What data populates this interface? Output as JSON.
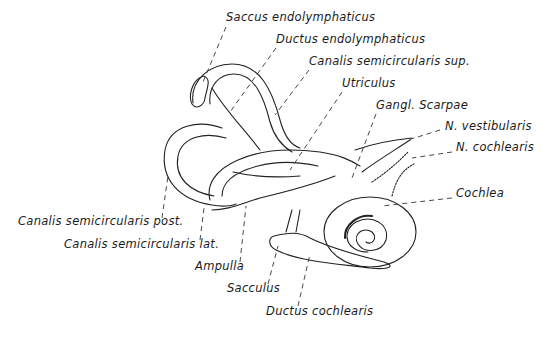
{
  "diagram": {
    "labels": [
      {
        "id": "saccus",
        "text": "Saccus endolymphaticus",
        "x": 226,
        "y": 17
      },
      {
        "id": "ductus_endo",
        "text": "Ductus endolymphaticus",
        "x": 276,
        "y": 39
      },
      {
        "id": "canalis_sup",
        "text": "Canalis semicircularis sup.",
        "x": 309,
        "y": 61
      },
      {
        "id": "utriculus",
        "text": "Utriculus",
        "x": 342,
        "y": 83
      },
      {
        "id": "gangl",
        "text": "Gangl. Scarpae",
        "x": 376,
        "y": 105
      },
      {
        "id": "n_vest",
        "text": "N. vestibularis",
        "x": 445,
        "y": 126
      },
      {
        "id": "n_coch",
        "text": "N. cochlearis",
        "x": 456,
        "y": 147
      },
      {
        "id": "cochlea",
        "text": "Cochlea",
        "x": 456,
        "y": 193
      },
      {
        "id": "canalis_post",
        "text": "Canalis semicircularis post.",
        "x": 18,
        "y": 221
      },
      {
        "id": "canalis_lat",
        "text": "Canalis semicircularis lat.",
        "x": 64,
        "y": 244
      },
      {
        "id": "ampulla",
        "text": "Ampulla",
        "x": 195,
        "y": 266
      },
      {
        "id": "sacculus",
        "text": "Sacculus",
        "x": 227,
        "y": 288
      },
      {
        "id": "ductus_coch",
        "text": "Ductus cochlearis",
        "x": 266,
        "y": 311
      }
    ]
  }
}
